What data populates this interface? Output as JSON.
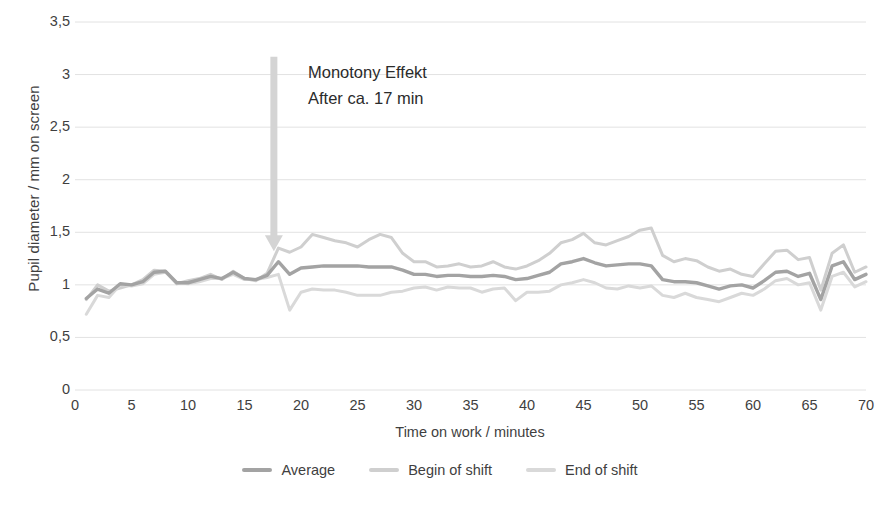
{
  "chart_data": {
    "type": "line",
    "title": "",
    "xlabel": "Time on work / minutes",
    "ylabel": "Pupil diameter / mm on screen",
    "xlim": [
      0,
      70
    ],
    "ylim": [
      0,
      3.5
    ],
    "xticks": [
      0,
      5,
      10,
      15,
      20,
      25,
      30,
      35,
      40,
      45,
      50,
      55,
      60,
      65,
      70
    ],
    "xtick_labels": [
      "0",
      "5",
      "10",
      "15",
      "20",
      "25",
      "30",
      "35",
      "40",
      "45",
      "50",
      "55",
      "60",
      "65",
      "70"
    ],
    "yticks": [
      0,
      0.5,
      1,
      1.5,
      2,
      2.5,
      3,
      3.5
    ],
    "ytick_labels": [
      "0",
      "0,5",
      "1",
      "1,5",
      "2",
      "2,5",
      "3",
      "3,5"
    ],
    "grid": true,
    "legend_position": "bottom",
    "x": [
      1,
      2,
      3,
      4,
      5,
      6,
      7,
      8,
      9,
      10,
      11,
      12,
      13,
      14,
      15,
      16,
      17,
      18,
      19,
      20,
      21,
      22,
      23,
      24,
      25,
      26,
      27,
      28,
      29,
      30,
      31,
      32,
      33,
      34,
      35,
      36,
      37,
      38,
      39,
      40,
      41,
      42,
      43,
      44,
      45,
      46,
      47,
      48,
      49,
      50,
      51,
      52,
      53,
      54,
      55,
      56,
      57,
      58,
      59,
      60,
      61,
      62,
      63,
      64,
      65,
      66,
      67,
      68,
      69,
      70
    ],
    "series": [
      {
        "name": "Average",
        "color": "#a3a3a3",
        "values": [
          0.87,
          0.96,
          0.92,
          1.01,
          1.0,
          1.03,
          1.12,
          1.13,
          1.02,
          1.02,
          1.05,
          1.08,
          1.06,
          1.12,
          1.06,
          1.05,
          1.09,
          1.22,
          1.1,
          1.16,
          1.17,
          1.18,
          1.18,
          1.18,
          1.18,
          1.17,
          1.17,
          1.17,
          1.14,
          1.1,
          1.1,
          1.08,
          1.09,
          1.09,
          1.08,
          1.08,
          1.09,
          1.08,
          1.05,
          1.06,
          1.09,
          1.12,
          1.2,
          1.22,
          1.25,
          1.21,
          1.18,
          1.19,
          1.2,
          1.2,
          1.18,
          1.05,
          1.03,
          1.03,
          1.02,
          0.99,
          0.96,
          0.99,
          1.0,
          0.97,
          1.04,
          1.12,
          1.13,
          1.08,
          1.11,
          0.86,
          1.18,
          1.22,
          1.05,
          1.1
        ]
      },
      {
        "name": "Begin of shift",
        "color": "#cfcfcf",
        "values": [
          0.86,
          1.0,
          0.94,
          0.97,
          1.0,
          1.05,
          1.14,
          1.13,
          1.01,
          1.04,
          1.06,
          1.1,
          1.05,
          1.13,
          1.06,
          1.04,
          1.11,
          1.35,
          1.31,
          1.36,
          1.48,
          1.45,
          1.42,
          1.4,
          1.36,
          1.43,
          1.48,
          1.45,
          1.3,
          1.22,
          1.22,
          1.17,
          1.18,
          1.2,
          1.17,
          1.18,
          1.22,
          1.17,
          1.15,
          1.18,
          1.23,
          1.3,
          1.4,
          1.43,
          1.49,
          1.4,
          1.38,
          1.42,
          1.46,
          1.52,
          1.54,
          1.28,
          1.22,
          1.25,
          1.23,
          1.17,
          1.13,
          1.15,
          1.1,
          1.08,
          1.2,
          1.32,
          1.33,
          1.24,
          1.26,
          0.95,
          1.3,
          1.38,
          1.12,
          1.17
        ]
      },
      {
        "name": "End of shift",
        "color": "#d9d9d9",
        "values": [
          0.72,
          0.9,
          0.88,
          1.0,
          0.99,
          1.01,
          1.1,
          1.12,
          1.02,
          1.01,
          1.03,
          1.06,
          1.06,
          1.1,
          1.05,
          1.05,
          1.07,
          1.1,
          0.76,
          0.93,
          0.96,
          0.95,
          0.95,
          0.93,
          0.9,
          0.9,
          0.9,
          0.93,
          0.94,
          0.97,
          0.98,
          0.95,
          0.98,
          0.97,
          0.97,
          0.93,
          0.96,
          0.97,
          0.85,
          0.93,
          0.93,
          0.94,
          1.0,
          1.02,
          1.05,
          1.02,
          0.97,
          0.96,
          0.99,
          0.97,
          0.99,
          0.9,
          0.88,
          0.92,
          0.88,
          0.86,
          0.84,
          0.88,
          0.92,
          0.9,
          0.96,
          1.04,
          1.06,
          1.0,
          1.02,
          0.76,
          1.08,
          1.12,
          0.98,
          1.03
        ]
      }
    ],
    "annotations": [
      {
        "name": "monotony-effect",
        "line1": "Monotony Effekt",
        "line2": "After ca. 17 min",
        "arrow": {
          "at_x": 17.6,
          "from_y": 3.17,
          "to_y": 1.32,
          "color": "#d4d4d4"
        }
      }
    ]
  },
  "legend": {
    "items": [
      {
        "label": "Average",
        "color": "#a3a3a3"
      },
      {
        "label": "Begin of shift",
        "color": "#cfcfcf"
      },
      {
        "label": "End of shift",
        "color": "#d9d9d9"
      }
    ]
  },
  "style": {
    "grid_color": "#e2e2e2",
    "text_color": "#3f3f3f",
    "background": "#ffffff"
  }
}
